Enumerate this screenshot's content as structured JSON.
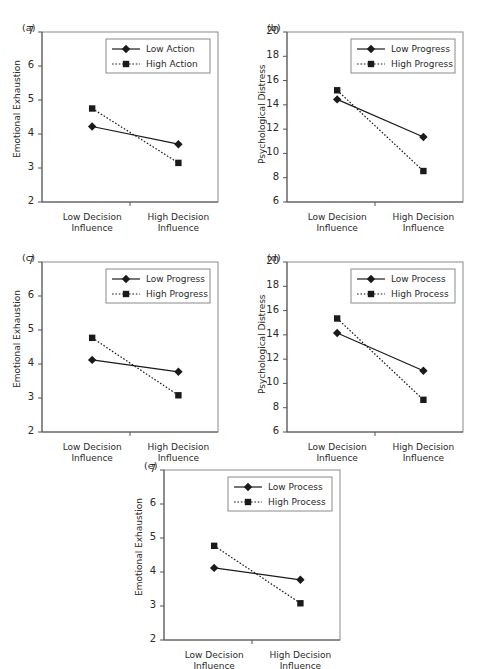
{
  "figure": {
    "background": "#ffffff",
    "line_color": "#1a1a1a",
    "frame_color": "#8a8a8a",
    "axis_color": "#555555"
  },
  "x_categories": [
    "Low Decision Influence",
    "High Decision Influence"
  ],
  "x_tick_lines": [
    "Low Decision",
    "Influence",
    "High Decision",
    "Influence"
  ],
  "chart_data": [
    {
      "id": "a",
      "label": "(a)",
      "type": "line",
      "title": "",
      "xlabel": "",
      "ylabel": "Emotional Exhaustion",
      "categories": [
        "Low Decision Influence",
        "High Decision Influence"
      ],
      "ylim": [
        2,
        7
      ],
      "yticks": [
        2,
        3,
        4,
        5,
        6,
        7
      ],
      "grid": false,
      "legend_position": "top-right",
      "series": [
        {
          "name": "Low Action",
          "values": [
            4.22,
            3.7
          ],
          "style": "solid",
          "marker": "diamond"
        },
        {
          "name": "High Action",
          "values": [
            4.75,
            3.15
          ],
          "style": "dotted",
          "marker": "square"
        }
      ]
    },
    {
      "id": "b",
      "label": "(b)",
      "type": "line",
      "title": "",
      "xlabel": "",
      "ylabel": "Psychological Distress",
      "categories": [
        "Low Decision Influence",
        "High Decision Influence"
      ],
      "ylim": [
        6,
        20
      ],
      "yticks": [
        6,
        8,
        10,
        12,
        14,
        16,
        18,
        20
      ],
      "grid": false,
      "legend_position": "top-right",
      "series": [
        {
          "name": "Low Progress",
          "values": [
            14.45,
            11.35
          ],
          "style": "solid",
          "marker": "diamond"
        },
        {
          "name": "High Progress",
          "values": [
            15.2,
            8.55
          ],
          "style": "dotted",
          "marker": "square"
        }
      ]
    },
    {
      "id": "c",
      "label": "(c)",
      "type": "line",
      "title": "",
      "xlabel": "",
      "ylabel": "Emotional Exhaustion",
      "categories": [
        "Low Decision Influence",
        "High Decision Influence"
      ],
      "ylim": [
        2,
        7
      ],
      "yticks": [
        2,
        3,
        4,
        5,
        6,
        7
      ],
      "grid": false,
      "legend_position": "top-right",
      "series": [
        {
          "name": "Low Progress",
          "values": [
            4.12,
            3.77
          ],
          "style": "solid",
          "marker": "diamond"
        },
        {
          "name": "High Progress",
          "values": [
            4.77,
            3.08
          ],
          "style": "dotted",
          "marker": "square"
        }
      ]
    },
    {
      "id": "d",
      "label": "(d)",
      "type": "line",
      "title": "",
      "xlabel": "",
      "ylabel": "Psychological Distress",
      "categories": [
        "Low Decision Influence",
        "High Decision Influence"
      ],
      "ylim": [
        6,
        20
      ],
      "yticks": [
        6,
        8,
        10,
        12,
        14,
        16,
        18,
        20
      ],
      "grid": false,
      "legend_position": "top-right",
      "series": [
        {
          "name": "Low Process",
          "values": [
            14.15,
            11.05
          ],
          "style": "solid",
          "marker": "diamond"
        },
        {
          "name": "High Process",
          "values": [
            15.35,
            8.65
          ],
          "style": "dotted",
          "marker": "square"
        }
      ]
    },
    {
      "id": "e",
      "label": "(e)",
      "type": "line",
      "title": "",
      "xlabel": "",
      "ylabel": "Emotional Exhaustion",
      "categories": [
        "Low Decision Influence",
        "High Decision Influence"
      ],
      "ylim": [
        2,
        7
      ],
      "yticks": [
        2,
        3,
        4,
        5,
        6,
        7
      ],
      "grid": false,
      "legend_position": "top-right",
      "series": [
        {
          "name": "Low Process",
          "values": [
            4.12,
            3.77
          ],
          "style": "solid",
          "marker": "diamond"
        },
        {
          "name": "High Process",
          "values": [
            4.77,
            3.08
          ],
          "style": "dotted",
          "marker": "square"
        }
      ]
    }
  ]
}
